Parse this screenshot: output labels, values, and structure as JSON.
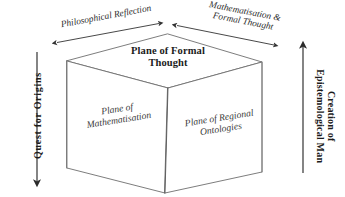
{
  "diagram": {
    "background_color": "#ffffff",
    "line_color": "#555555",
    "text_color": "#1b1b1b",
    "arrow_color": "#333333"
  },
  "cube": {
    "faces": {
      "top": {
        "label": "Plane of Formal\nThought"
      },
      "left": {
        "label": "Plane of\nMathematisation"
      },
      "right": {
        "label": "Plane of Regional\nOntologies"
      }
    }
  },
  "axes": {
    "left_top": {
      "label": "Philosophical Reflection",
      "arrow": "double-headed",
      "direction": "diagonal-up-right"
    },
    "right_top": {
      "label": "Mathematisation &\nFormal Thought",
      "arrow": "double-headed",
      "direction": "diagonal-down-right"
    },
    "left_side": {
      "label": "Quest  for  Origins",
      "arrow": "single-headed",
      "direction": "down"
    },
    "right_side": {
      "label": "Creation of\nEpistemological Man",
      "arrow": "single-headed",
      "direction": "up"
    }
  }
}
